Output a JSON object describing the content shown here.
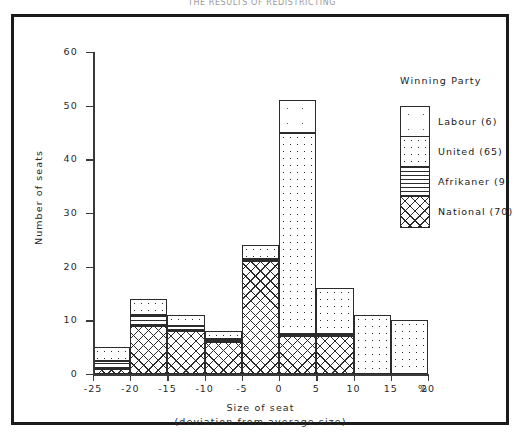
{
  "figure": {
    "title": "THE RESULTS OF REDISTRICTING"
  },
  "legend": {
    "title": "Winning Party",
    "entries": [
      {
        "name": "Labour",
        "label": "Labour (6)",
        "seats": 6,
        "pattern": "sparse-dots"
      },
      {
        "name": "United",
        "label": "United (65)",
        "seats": 65,
        "pattern": "dense-dots"
      },
      {
        "name": "Afrikaner",
        "label": "Afrikaner (9)",
        "seats": 9,
        "pattern": "horizontal-lines"
      },
      {
        "name": "National",
        "label": "National (70)",
        "seats": 70,
        "pattern": "crosshatch"
      }
    ]
  },
  "chart_data": {
    "type": "bar",
    "subtype": "stacked-histogram",
    "title": "THE RESULTS OF REDISTRICTING",
    "xlabel": "Size of seat",
    "xlabel_sub": "(deviation from average size)",
    "ylabel": "Number of seats",
    "xunit": "%",
    "xlim": [
      -25,
      20
    ],
    "ylim": [
      0,
      60
    ],
    "yticks": [
      0,
      10,
      20,
      30,
      40,
      50,
      60
    ],
    "xticks": [
      -25,
      -20,
      -15,
      -10,
      -5,
      0,
      5,
      10,
      15,
      20
    ],
    "xtick_labels": [
      "-25",
      "-20",
      "-15",
      "-10",
      "-5",
      "0",
      "5",
      "10",
      "15",
      "20"
    ],
    "grid": false,
    "legend_position": "top-right",
    "bin_width": 5,
    "bin_starts": [
      -25,
      -20,
      -15,
      -10,
      -5,
      0,
      5,
      10,
      15
    ],
    "bin_labels": [
      "-25 to -20",
      "-20 to -15",
      "-15 to -10",
      "-10 to -5",
      "-5 to 0",
      "0 to 5",
      "5 to 10",
      "10 to 15",
      "15 to 20"
    ],
    "series": [
      {
        "name": "National",
        "values": [
          1.0,
          9.0,
          8.0,
          6.0,
          21.0,
          7.0,
          7.0,
          0.0,
          0.0
        ]
      },
      {
        "name": "Afrikaner",
        "values": [
          1.5,
          2.0,
          1.0,
          0.5,
          0.5,
          0.5,
          0.5,
          0.0,
          0.0
        ]
      },
      {
        "name": "United",
        "values": [
          2.5,
          3.0,
          2.0,
          1.5,
          2.5,
          37.5,
          8.5,
          11.0,
          10.0
        ]
      },
      {
        "name": "Labour",
        "values": [
          0.0,
          0.0,
          0.0,
          0.0,
          0.0,
          6.0,
          0.0,
          0.0,
          0.0
        ]
      }
    ],
    "totals": [
      5,
      14,
      11,
      8,
      24,
      51,
      16,
      11,
      10
    ]
  }
}
